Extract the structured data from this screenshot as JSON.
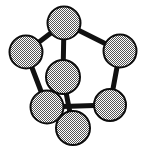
{
  "figure": {
    "title": "Stippled node graph diagram",
    "type": "graph-diagram",
    "background_color": "#ffffff",
    "width": 144,
    "height": 151
  },
  "style": {
    "node_fill_pattern": "checkerboard-stipple-50-percent",
    "node_fill_light": "#ffffff",
    "node_fill_dark": "#5a5a5a",
    "node_stroke_color": "#0d0d0d",
    "node_stroke_width": 2,
    "edge_color": "#111111",
    "edge_width": 5,
    "node_radius": 16.5
  },
  "chart_data": {
    "type": "scatter",
    "title": "Stippled node graph diagram",
    "xlabel": "",
    "ylabel": "",
    "grid": false,
    "legend": "none",
    "xlim": [
      0,
      144
    ],
    "ylim": [
      0,
      151
    ],
    "nodes": [
      {
        "id": "n1",
        "label": "top",
        "x": 64,
        "y": 23,
        "r": 16.5
      },
      {
        "id": "n2",
        "label": "top-left",
        "x": 26,
        "y": 52,
        "r": 16.5
      },
      {
        "id": "n3",
        "label": "top-right",
        "x": 120,
        "y": 51,
        "r": 16.5
      },
      {
        "id": "n4",
        "label": "center",
        "x": 63,
        "y": 77,
        "r": 17.0
      },
      {
        "id": "n5",
        "label": "bottom-left",
        "x": 47,
        "y": 107,
        "r": 16.5
      },
      {
        "id": "n6",
        "label": "bottom-right",
        "x": 110,
        "y": 105,
        "r": 16.0
      },
      {
        "id": "n7",
        "label": "bottom",
        "x": 73,
        "y": 128,
        "r": 17.0
      }
    ],
    "edges": [
      {
        "id": "e1",
        "source": "n1",
        "target": "n2"
      },
      {
        "id": "e2",
        "source": "n1",
        "target": "n3"
      },
      {
        "id": "e3",
        "source": "n1",
        "target": "n4"
      },
      {
        "id": "e4",
        "source": "n2",
        "target": "n5"
      },
      {
        "id": "e5",
        "source": "n3",
        "target": "n6"
      },
      {
        "id": "e6",
        "source": "n4",
        "target": "n7"
      },
      {
        "id": "e7",
        "source": "n5",
        "target": "n6"
      },
      {
        "id": "e8",
        "source": "n5",
        "target": "n7"
      }
    ],
    "node_count": 7,
    "edge_count": 8
  }
}
